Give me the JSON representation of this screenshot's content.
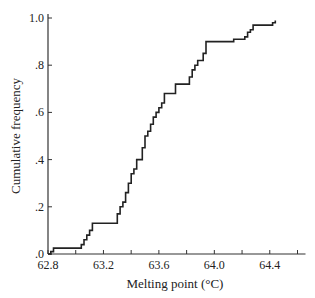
{
  "chart_data": {
    "type": "line",
    "subtype": "step-cumulative",
    "title": "",
    "xlabel": "Melting point (°C)",
    "ylabel": "Cumulative frequency",
    "xlim": [
      62.8,
      64.6
    ],
    "ylim": [
      0.0,
      1.0
    ],
    "x_ticks": [
      62.8,
      63.0,
      63.2,
      63.4,
      63.6,
      63.8,
      64.0,
      64.2,
      64.4,
      64.6
    ],
    "x_tick_labels": [
      "62.8",
      "",
      "63.2",
      "",
      "63.6",
      "",
      "64.0",
      "",
      "64.4",
      ""
    ],
    "y_ticks": [
      0.0,
      0.2,
      0.4,
      0.6,
      0.8,
      1.0
    ],
    "y_tick_labels": [
      ".0",
      ".2",
      ".4",
      ".6",
      ".8",
      "1.0"
    ],
    "grid": false,
    "legend": null,
    "line_color": "#222222",
    "series": [
      {
        "name": "Cumulative frequency",
        "x": [
          62.8,
          62.82,
          62.84,
          63.02,
          63.04,
          63.06,
          63.08,
          63.1,
          63.12,
          63.28,
          63.3,
          63.32,
          63.34,
          63.36,
          63.38,
          63.4,
          63.42,
          63.44,
          63.46,
          63.48,
          63.5,
          63.52,
          63.54,
          63.56,
          63.58,
          63.6,
          63.62,
          63.64,
          63.7,
          63.72,
          63.8,
          63.82,
          63.84,
          63.86,
          63.88,
          63.92,
          63.94,
          64.12,
          64.14,
          64.22,
          64.24,
          64.26,
          64.28,
          64.4,
          64.42,
          64.44
        ],
        "y": [
          0.0,
          0.01,
          0.025,
          0.025,
          0.04,
          0.06,
          0.08,
          0.1,
          0.13,
          0.13,
          0.17,
          0.2,
          0.22,
          0.26,
          0.3,
          0.34,
          0.36,
          0.4,
          0.4,
          0.45,
          0.5,
          0.52,
          0.55,
          0.58,
          0.6,
          0.62,
          0.64,
          0.68,
          0.68,
          0.72,
          0.72,
          0.75,
          0.78,
          0.8,
          0.82,
          0.85,
          0.9,
          0.9,
          0.91,
          0.92,
          0.94,
          0.95,
          0.97,
          0.97,
          0.98,
          0.99
        ]
      }
    ]
  }
}
